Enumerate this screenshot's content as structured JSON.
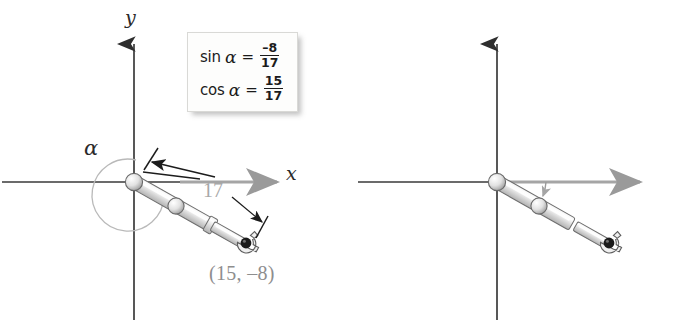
{
  "figure": {
    "background_color": "#ffffff",
    "axis_color": "#2f2f2f",
    "arm_color": "#bfbfbf",
    "gray_text_color": "#8e8e8e"
  },
  "panels": [
    {
      "id": "left",
      "angle_symbol": "α",
      "formula": {
        "line1": {
          "function": "sin",
          "angle": "α",
          "equals": "=",
          "numerator": "–8",
          "denominator": "17"
        },
        "line2": {
          "function": "cos",
          "angle": "α",
          "equals": "=",
          "numerator": "15",
          "denominator": "17"
        }
      },
      "axis_labels": {
        "x": "x",
        "y": "y"
      },
      "angle_label": "α",
      "length_label": "17",
      "point_label": "(15, –8)",
      "arc_type": "full-rotation-reflex",
      "arm_angle_degrees": -28
    },
    {
      "id": "right",
      "angle_symbol": "β",
      "formula": {
        "line1": {
          "function": "sin",
          "angle": "β",
          "equals": "=",
          "numerator": "–8",
          "denominator": "17"
        },
        "line2": {
          "function": "cos",
          "angle": "β",
          "equals": "=",
          "numerator": "15",
          "denominator": "17"
        }
      },
      "axis_labels": {
        "x": "x",
        "y": "y"
      },
      "angle_label": "β",
      "length_label": "",
      "point_label": "(15, –8)",
      "arc_type": "small-clockwise",
      "arm_angle_degrees": -28
    }
  ]
}
